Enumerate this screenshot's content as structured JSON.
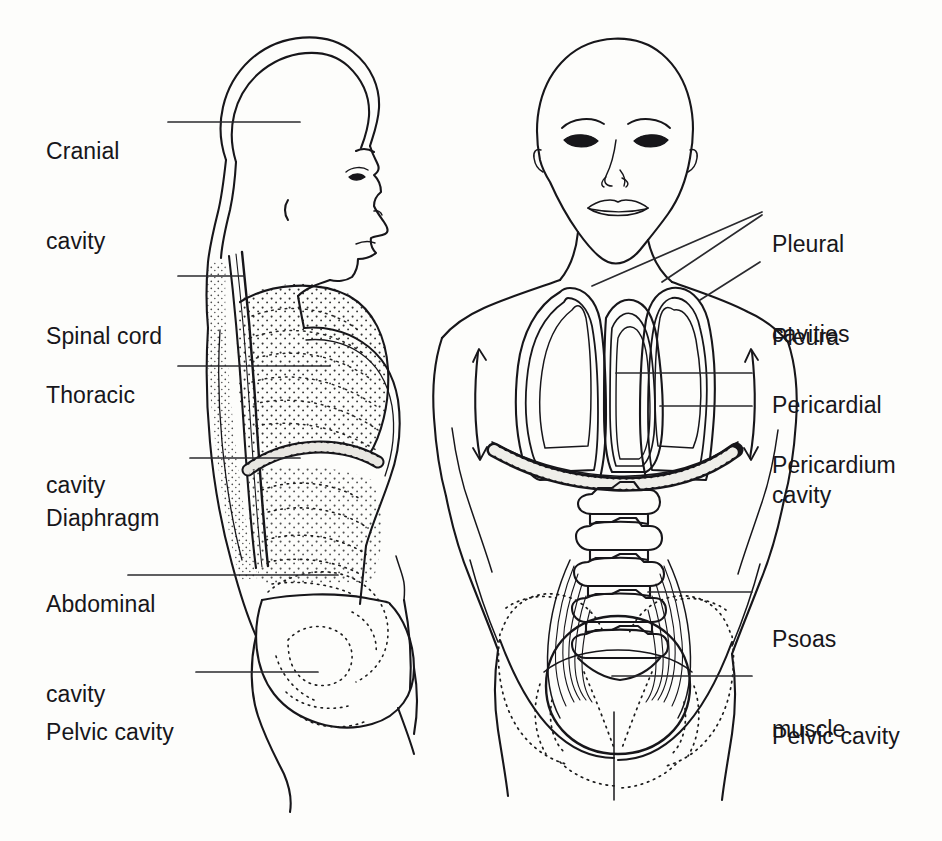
{
  "figure": {
    "type": "anatomical-diagram",
    "views": [
      {
        "name": "lateral-view",
        "description": "Side (sagittal) view of head and trunk showing cranial, thoracic, abdominal and pelvic cavities"
      },
      {
        "name": "anterior-view",
        "description": "Front view of head and trunk showing pleural cavities, pericardium, diaphragm, lumbar vertebrae, psoas muscle and pelvic cavity"
      }
    ],
    "background_color": "#fdfdfb",
    "ink_color": "#17161a"
  },
  "labels": {
    "left": [
      {
        "id": "cranial-cavity",
        "line1": "Cranial",
        "line2": "cavity"
      },
      {
        "id": "spinal-cord",
        "line1": "Spinal cord",
        "line2": ""
      },
      {
        "id": "thoracic-cavity",
        "line1": "Thoracic",
        "line2": "cavity"
      },
      {
        "id": "diaphragm",
        "line1": "Diaphragm",
        "line2": ""
      },
      {
        "id": "abdominal-cavity",
        "line1": "Abdominal",
        "line2": "cavity"
      },
      {
        "id": "pelvic-cavity",
        "line1": "Pelvic cavity",
        "line2": ""
      }
    ],
    "right": [
      {
        "id": "pleural-cavities",
        "line1": "Pleural",
        "line2": "cavities"
      },
      {
        "id": "pleura",
        "line1": "Pleura",
        "line2": ""
      },
      {
        "id": "pericardial-cavity",
        "line1": "Pericardial",
        "line2": "cavity"
      },
      {
        "id": "pericardium",
        "line1": "Pericardium",
        "line2": ""
      },
      {
        "id": "psoas-muscle",
        "line1": "Psoas",
        "line2": "muscle"
      },
      {
        "id": "pelvic-cavity-right",
        "line1": "Pelvic cavity",
        "line2": ""
      }
    ]
  }
}
